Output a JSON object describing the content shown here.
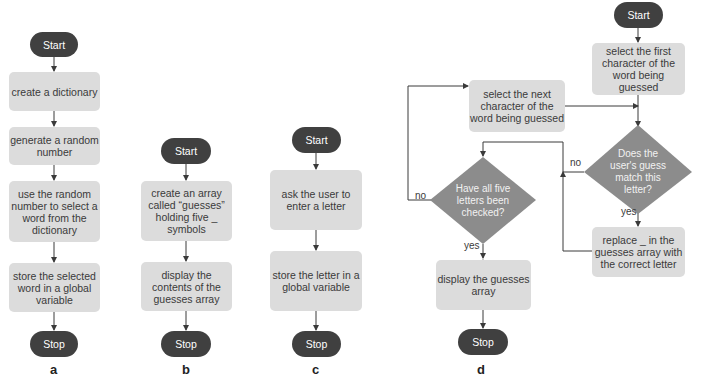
{
  "colors": {
    "terminal": "#404040",
    "process": "#dcdcdc",
    "decision": "#8c8c8c",
    "line": "#3a3a3a"
  },
  "flowcharts": {
    "a": {
      "caption": "a",
      "start": "Start",
      "steps": [
        "create a dictionary",
        "generate a random number",
        "use the random number to select a word from the dictionary",
        "store the selected word in a global variable"
      ],
      "stop": "Stop"
    },
    "b": {
      "caption": "b",
      "start": "Start",
      "steps": [
        "create an array called “guesses” holding five _ symbols",
        "display the contents of the guesses array"
      ],
      "stop": "Stop"
    },
    "c": {
      "caption": "c",
      "start": "Start",
      "steps": [
        "ask the user to enter a letter",
        "store the letter in a global variable"
      ],
      "stop": "Stop"
    },
    "d": {
      "caption": "d",
      "start": "Start",
      "select_first": "select the first character of the word being guessed",
      "select_next": "select the next character of the word being guessed",
      "decision_match": "Does the user's guess match this letter?",
      "decision_all_checked": "Have all five letters been checked?",
      "replace": "replace _ in the guesses array with the correct letter",
      "display": "display the guesses array",
      "stop": "Stop",
      "labels": {
        "no_match": "no",
        "yes_match": "yes",
        "no_checked": "no",
        "yes_checked": "yes"
      }
    }
  }
}
